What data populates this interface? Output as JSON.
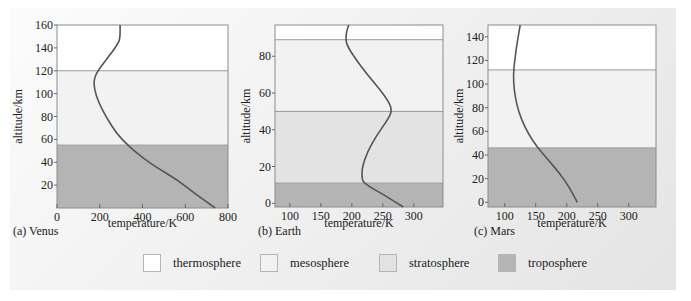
{
  "colors": {
    "thermosphere": "#ffffff",
    "mesosphere": "#f2f2f2",
    "stratosphere": "#e3e3e3",
    "troposphere": "#b4b4b4",
    "curve": "#555555",
    "frame": "#8c8c8c"
  },
  "legend": [
    {
      "label": "thermosphere",
      "key": "thermosphere"
    },
    {
      "label": "mesosphere",
      "key": "mesosphere"
    },
    {
      "label": "stratosphere",
      "key": "stratosphere"
    },
    {
      "label": "troposphere",
      "key": "troposphere"
    }
  ],
  "chart_data": [
    {
      "type": "line",
      "title": "(a) Venus",
      "xlabel": "temperature/K",
      "ylabel": "altitude/km",
      "xlim": [
        0,
        800
      ],
      "ylim": [
        0,
        160
      ],
      "xticks": [
        0,
        200,
        400,
        600,
        800
      ],
      "yticks": [
        20,
        40,
        60,
        80,
        100,
        120,
        140,
        160
      ],
      "grid": false,
      "layers": [
        {
          "name": "troposphere",
          "from": 0,
          "to": 55
        },
        {
          "name": "mesosphere",
          "from": 55,
          "to": 120
        },
        {
          "name": "thermosphere",
          "from": 120,
          "to": 160
        }
      ],
      "series": [
        {
          "name": "temperature profile",
          "points": [
            [
              740,
              0
            ],
            [
              650,
              12
            ],
            [
              560,
              25
            ],
            [
              470,
              35
            ],
            [
              400,
              44
            ],
            [
              330,
              55
            ],
            [
              280,
              65
            ],
            [
              235,
              78
            ],
            [
              195,
              92
            ],
            [
              175,
              104
            ],
            [
              172,
              112
            ],
            [
              190,
              120
            ],
            [
              240,
              132
            ],
            [
              280,
              142
            ],
            [
              295,
              148
            ],
            [
              295,
              160
            ]
          ]
        }
      ]
    },
    {
      "type": "line",
      "title": "(b) Earth",
      "xlabel": "temperature/K",
      "ylabel": "altitude/km",
      "xlim": [
        76,
        347
      ],
      "ylim": [
        -2,
        97
      ],
      "xticks": [
        100,
        150,
        200,
        250,
        300
      ],
      "yticks": [
        0,
        20,
        40,
        60,
        80
      ],
      "grid": false,
      "layers": [
        {
          "name": "troposphere",
          "from": -2,
          "to": 11
        },
        {
          "name": "stratosphere",
          "from": 11,
          "to": 50
        },
        {
          "name": "mesosphere",
          "from": 50,
          "to": 89
        },
        {
          "name": "thermosphere",
          "from": 89,
          "to": 97
        }
      ],
      "series": [
        {
          "name": "temperature profile",
          "points": [
            [
              283,
              -2
            ],
            [
              250,
              5
            ],
            [
              218,
              11
            ],
            [
              216,
              15
            ],
            [
              217,
              20
            ],
            [
              225,
              28
            ],
            [
              240,
              37
            ],
            [
              255,
              44
            ],
            [
              265,
              50
            ],
            [
              260,
              55
            ],
            [
              245,
              62
            ],
            [
              225,
              70
            ],
            [
              205,
              79
            ],
            [
              192,
              86
            ],
            [
              190,
              90
            ],
            [
              192,
              94
            ],
            [
              195,
              97
            ]
          ]
        }
      ]
    },
    {
      "type": "line",
      "title": "(c) Mars",
      "xlabel": "temperature/K",
      "ylabel": "altitude/km",
      "xlim": [
        73,
        344
      ],
      "ylim": [
        -4,
        150
      ],
      "xticks": [
        100,
        150,
        200,
        250,
        300
      ],
      "yticks": [
        0,
        20,
        40,
        60,
        80,
        100,
        120,
        140
      ],
      "grid": false,
      "layers": [
        {
          "name": "troposphere",
          "from": -4,
          "to": 46
        },
        {
          "name": "mesosphere",
          "from": 46,
          "to": 112
        },
        {
          "name": "thermosphere",
          "from": 112,
          "to": 150
        }
      ],
      "series": [
        {
          "name": "temperature profile",
          "points": [
            [
              217,
              0
            ],
            [
              205,
              12
            ],
            [
              188,
              25
            ],
            [
              168,
              37
            ],
            [
              152,
              47
            ],
            [
              138,
              58
            ],
            [
              127,
              70
            ],
            [
              119,
              83
            ],
            [
              115,
              96
            ],
            [
              114,
              108
            ],
            [
              116,
              120
            ],
            [
              120,
              135
            ],
            [
              125,
              150
            ]
          ]
        }
      ]
    }
  ]
}
